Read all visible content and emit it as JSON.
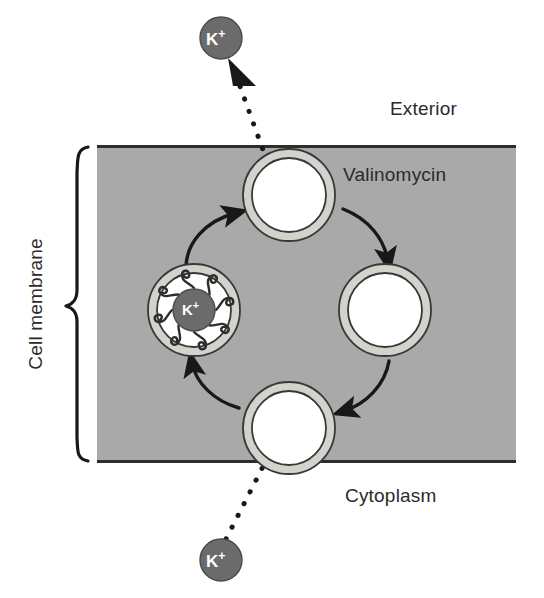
{
  "figure": {
    "type": "biological-process-diagram"
  },
  "labels": {
    "exterior": "Exterior",
    "valinomycin": "Valinomycin",
    "cytoplasm": "Cytoplasm",
    "cell_membrane": "Cell membrane"
  },
  "ions": {
    "symbol": "K",
    "charge": "+",
    "exterior_ion": "K+",
    "cytoplasm_ion": "K+",
    "bound_ion": "K+"
  },
  "colors": {
    "membrane_fill": "#a9a9a9",
    "membrane_edge": "#2f2c2d",
    "carrier_ring_fill": "#d4d2cd",
    "carrier_ring_stroke": "#3a3738",
    "carrier_interior": "#ffffff",
    "ion_fill": "#6b6b6b",
    "ion_stroke": "#4a4a4a",
    "ion_text": "#ffffff",
    "arrow": "#1a1718",
    "text": "#2d2a2b",
    "background": "#ffffff"
  },
  "geometry": {
    "membrane": {
      "x": 97,
      "y": 146,
      "width": 419,
      "height": 316
    },
    "carriers": [
      {
        "name": "carrier-top-loading",
        "cx": 289,
        "cy": 195,
        "r_outer": 46,
        "r_inner": 37
      },
      {
        "name": "carrier-right-empty",
        "cx": 385,
        "cy": 310,
        "r_outer": 46,
        "r_inner": 37
      },
      {
        "name": "carrier-bottom-releasing",
        "cx": 289,
        "cy": 428,
        "r_outer": 46,
        "r_inner": 37
      },
      {
        "name": "carrier-left-complex",
        "cx": 194,
        "cy": 310,
        "r_outer": 46,
        "r_inner": 37
      }
    ],
    "ions": [
      {
        "name": "ion-exterior",
        "cx": 221,
        "cy": 38,
        "r": 21
      },
      {
        "name": "ion-cytoplasm",
        "cx": 221,
        "cy": 560,
        "r": 21
      },
      {
        "name": "ion-bound",
        "cx": 194,
        "cy": 310,
        "r": 21
      }
    ]
  },
  "process": {
    "direction": "counterclockwise",
    "steps": [
      "Potassium ion binds valinomycin at the exterior face",
      "Loaded carrier diffuses through the membrane",
      "Potassium ion is released into the cytoplasm",
      "Empty carrier returns to the exterior face"
    ],
    "arrow_count": 4,
    "dotted_arrow_count": 2
  }
}
